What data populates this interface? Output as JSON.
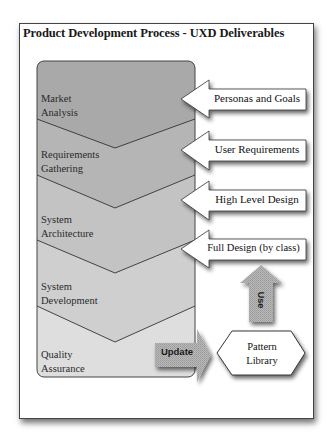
{
  "diagram": {
    "title": "Product Development Process - UXD Deliverables",
    "stages": [
      {
        "line1": "Market",
        "line2": "Analysis",
        "color": "#a9a9a9"
      },
      {
        "line1": "Requirements",
        "line2": "Gathering",
        "color": "#b5b5b5"
      },
      {
        "line1": "System",
        "line2": "Architecture",
        "color": "#c3c3c3"
      },
      {
        "line1": "System",
        "line2": "Development",
        "color": "#cfcfcf"
      },
      {
        "line1": "Quality",
        "line2": "Assurance",
        "color": "#dedede"
      }
    ],
    "deliverables": [
      {
        "label": "Personas and Goals"
      },
      {
        "label": "User Requirements"
      },
      {
        "label": "High Level Design"
      },
      {
        "label": "Full Design (by class)"
      }
    ],
    "pattern_library": {
      "line1": "Pattern",
      "line2": "Library"
    },
    "update_arrow": {
      "label": "Update"
    },
    "use_arrow": {
      "label": "Use"
    }
  }
}
